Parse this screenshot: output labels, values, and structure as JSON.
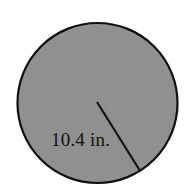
{
  "figure": {
    "background_color": "#ffffff",
    "circle": {
      "name": "shaded-circle",
      "center_x": 97.5,
      "center_y": 103,
      "radius": 80,
      "fill_color": "#8e8e8e",
      "stroke_color": "#101010",
      "stroke_width": 2.2
    },
    "radius_line": {
      "name": "radius-line",
      "x1": 97,
      "y1": 102,
      "x2": 139.5,
      "y2": 170,
      "stroke_color": "#121212",
      "stroke_width": 2.2
    },
    "label": {
      "text": "10.4 in.",
      "value": 10.4,
      "unit": "in.",
      "x": 51,
      "y": 146,
      "font_size": 19,
      "color": "#111111"
    }
  },
  "chart_data": {
    "type": "diagram",
    "shape": "circle",
    "annotations": [
      {
        "label": "10.4 in.",
        "measures": "radius",
        "value": 10.4,
        "unit": "in."
      }
    ],
    "elements": [
      {
        "name": "circle",
        "fill": "#8e8e8e",
        "stroke": "#101010"
      },
      {
        "name": "radius segment",
        "from": "center",
        "to": "circumference"
      }
    ]
  }
}
